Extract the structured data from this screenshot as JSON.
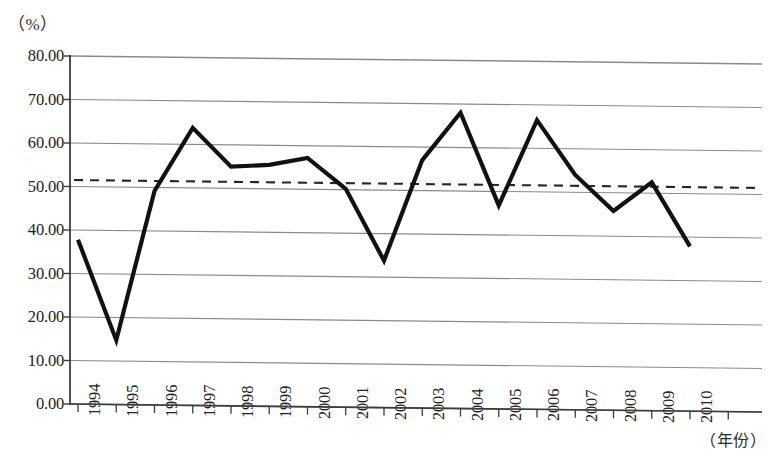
{
  "chart_data": {
    "type": "line",
    "title": "",
    "subtitle": "",
    "xlabel": "（年份）",
    "ylabel": "（%）",
    "categories": [
      "1994",
      "1995",
      "1996",
      "1997",
      "1998",
      "1999",
      "2000",
      "2001",
      "2002",
      "2003",
      "2004",
      "2005",
      "2006",
      "2007",
      "2008",
      "2009",
      "2010"
    ],
    "values": [
      37.8,
      14.8,
      49.2,
      63.8,
      55.0,
      55.5,
      57.2,
      50.2,
      33.8,
      57.0,
      68.0,
      46.8,
      66.5,
      54.0,
      45.8,
      52.5,
      37.9
    ],
    "series": [
      {
        "name": "比率",
        "values": [
          37.8,
          14.8,
          49.2,
          63.8,
          55.0,
          55.5,
          57.2,
          50.2,
          33.8,
          57.0,
          68.0,
          46.8,
          66.5,
          54.0,
          45.8,
          52.5,
          37.9
        ]
      }
    ],
    "reference_line": {
      "label": "平均值",
      "value": 51.5,
      "style": "dashed",
      "color": "#262626"
    },
    "ylim": [
      0,
      80
    ],
    "ytick_step": 10,
    "ytick_labels": [
      "0.00",
      "10.00",
      "20.00",
      "30.00",
      "40.00",
      "50.00",
      "60.00",
      "70.00",
      "80.00"
    ],
    "ytick_values": [
      0,
      10,
      20,
      30,
      40,
      50,
      60,
      70,
      80
    ],
    "xtick_labels": [
      "1994",
      "1995",
      "1996",
      "1997",
      "1998",
      "1999",
      "2000",
      "2001",
      "2002",
      "2003",
      "2004",
      "2005",
      "2006",
      "2007",
      "2008",
      "2009",
      "2010"
    ],
    "grid": true,
    "grid_axis": "y",
    "legend": false,
    "legend_position": "none",
    "line_color": "#111111",
    "grid_color": "#8a8a8a",
    "axis_color": "#3c3c3c",
    "background_color": "#ffffff",
    "annotations": []
  },
  "axes": {
    "y_unit_label": "（%）",
    "x_unit_label": "（年份）"
  }
}
